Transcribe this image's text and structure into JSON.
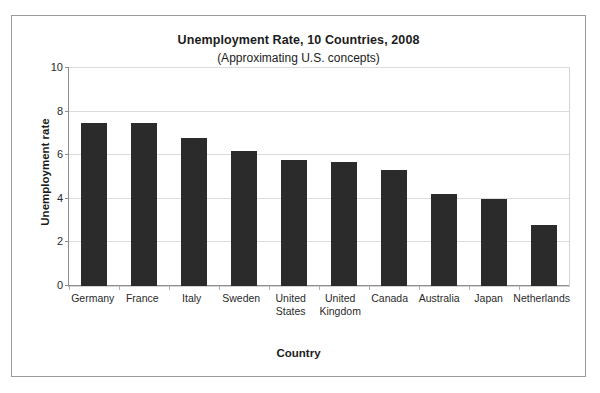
{
  "chart_data": {
    "type": "bar",
    "title": "Unemployment Rate, 10 Countries, 2008",
    "subtitle": "(Approximating U.S. concepts)",
    "xlabel": "Country",
    "ylabel": "Unemployment rate",
    "categories": [
      "Germany",
      "France",
      "Italy",
      "Sweden",
      "United States",
      "United Kingdom",
      "Canada",
      "Australia",
      "Japan",
      "Netherlands"
    ],
    "values": [
      7.5,
      7.5,
      6.8,
      6.2,
      5.8,
      5.7,
      5.3,
      4.2,
      4.0,
      2.8
    ],
    "ylim": [
      0,
      10
    ],
    "yticks": [
      0,
      2,
      4,
      6,
      8,
      10
    ],
    "ytick_labels": [
      "0",
      "2",
      "4",
      "6",
      "8",
      "10"
    ],
    "grid": true,
    "legend": false,
    "bar_color": "#2b2b2b",
    "gridline_color": "#dcdcdc",
    "axis_color": "#8f8f8f",
    "frame_color": "#9a9a9a",
    "background": "#ffffff"
  }
}
